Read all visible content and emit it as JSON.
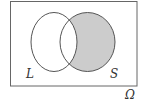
{
  "diagram": {
    "type": "venn",
    "universe_label": "Ω",
    "sets": [
      {
        "name": "L",
        "label": "L",
        "shaded": false
      },
      {
        "name": "S",
        "label": "S",
        "shaded": true
      }
    ],
    "shaded_region": "S \\ L",
    "colors": {
      "stroke": "#555555",
      "shade": "#cccccc",
      "background": "#ffffff"
    }
  }
}
